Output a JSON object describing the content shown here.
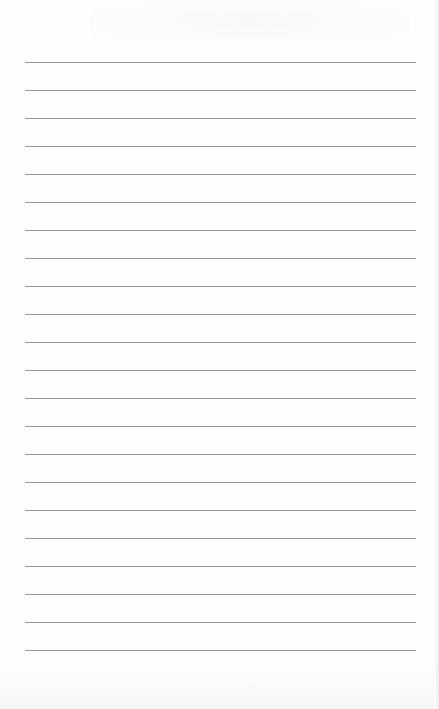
{
  "page": {
    "type": "lined-paper",
    "content_text": "",
    "line_color": "#9a9a9a",
    "background_color": "#fefefe",
    "rules": {
      "count": 22,
      "first_y": 62,
      "spacing": 28,
      "left": 25,
      "right": 416
    }
  }
}
